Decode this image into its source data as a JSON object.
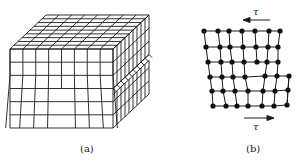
{
  "figure": {
    "panel_a": {
      "label": "(a)",
      "description": "3D block of cubic lattice cells with an edge dislocation (extra half-plane) — front face 8 columns x 6 rows, lower-right step"
    },
    "panel_b": {
      "label": "(b)",
      "description": "2D atomic lattice (dots) showing a dislocation under shear stress",
      "top_arrow": {
        "symbol": "τ",
        "direction": "left"
      },
      "bottom_arrow": {
        "symbol": "τ",
        "direction": "right"
      },
      "rows": [
        [
          [
            204,
            31
          ],
          [
            218,
            31
          ],
          [
            229,
            31
          ],
          [
            242,
            31
          ],
          [
            255,
            31
          ],
          [
            269,
            31
          ],
          [
            280,
            31
          ]
        ],
        [
          [
            206,
            47
          ],
          [
            220,
            47
          ],
          [
            230,
            47
          ],
          [
            243,
            47
          ],
          [
            256,
            47
          ],
          [
            268,
            47
          ],
          [
            278,
            47
          ]
        ],
        [
          [
            208,
            62
          ],
          [
            221,
            62
          ],
          [
            232,
            62
          ],
          [
            244,
            62
          ],
          [
            257,
            62
          ],
          [
            267,
            62
          ],
          [
            278,
            62
          ]
        ],
        [
          [
            210,
            77
          ],
          [
            222,
            77
          ],
          [
            233,
            77
          ],
          [
            245,
            77
          ],
          [
            265,
            76
          ],
          [
            277,
            76
          ],
          [
            289,
            76
          ]
        ],
        [
          [
            212,
            91
          ],
          [
            223,
            91
          ],
          [
            235,
            91
          ],
          [
            248,
            91
          ],
          [
            263,
            91
          ],
          [
            275,
            91
          ],
          [
            288,
            90
          ]
        ],
        [
          [
            213,
            106
          ],
          [
            226,
            106
          ],
          [
            237,
            106
          ],
          [
            248,
            106
          ],
          [
            262,
            106
          ],
          [
            274,
            106
          ],
          [
            287,
            105
          ]
        ]
      ]
    }
  },
  "colors": {
    "line": "#1a1a1a",
    "background": "#ffffff"
  }
}
